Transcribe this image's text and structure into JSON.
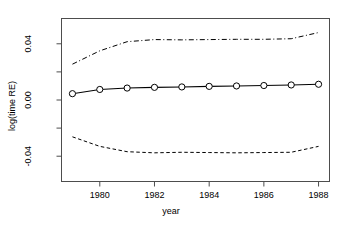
{
  "chart_data": {
    "type": "line",
    "title": "",
    "xlabel": "year",
    "ylabel": "log(time RE)",
    "grid": false,
    "legend": null,
    "xlim": [
      1978.6,
      1988.4
    ],
    "ylim": [
      -0.058,
      0.058
    ],
    "x_ticks": [
      1980,
      1982,
      1984,
      1986,
      1988
    ],
    "x_tick_labels": [
      "1980",
      "1982",
      "1984",
      "1986",
      "1988"
    ],
    "x_minor_ticks": [
      1979,
      1981,
      1983,
      1985,
      1987
    ],
    "y_ticks": [
      -0.04,
      0.0,
      0.04
    ],
    "y_tick_labels": [
      "-0.04",
      "0.00",
      "0.04"
    ],
    "y_minor_ticks": [
      -0.06,
      -0.02,
      0.02,
      0.06
    ],
    "x": [
      1979,
      1980,
      1981,
      1982,
      1983,
      1984,
      1985,
      1986,
      1987,
      1988
    ],
    "series": [
      {
        "name": "estimate",
        "style": "solid-with-circles",
        "color": "#000000",
        "marker": "open-circle",
        "values": [
          0.0045,
          0.0075,
          0.0085,
          0.009,
          0.0093,
          0.0097,
          0.01,
          0.0103,
          0.0107,
          0.0112
        ]
      },
      {
        "name": "upper-confidence-band",
        "style": "dashdot",
        "color": "#000000",
        "marker": "none",
        "values": [
          0.0255,
          0.035,
          0.0415,
          0.043,
          0.0428,
          0.043,
          0.0432,
          0.0432,
          0.0436,
          0.048
        ]
      },
      {
        "name": "lower-confidence-band",
        "style": "dashed",
        "color": "#000000",
        "marker": "none",
        "values": [
          -0.0262,
          -0.033,
          -0.0368,
          -0.0376,
          -0.0372,
          -0.0374,
          -0.0376,
          -0.0374,
          -0.0372,
          -0.033
        ]
      }
    ]
  }
}
